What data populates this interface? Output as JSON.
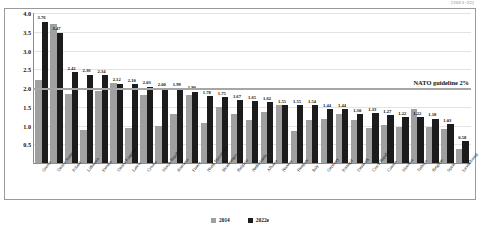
{
  "corner_tag": "[2021-22]",
  "chart_data": {
    "type": "bar",
    "title": "",
    "xlabel": "",
    "ylabel": "",
    "ylim": [
      0,
      4.0
    ],
    "yticks": [
      "0.5",
      "1.0",
      "1.5",
      "2.0",
      "2.5",
      "3.0",
      "3.5",
      "4.0"
    ],
    "grid": true,
    "legend_position": "bottom",
    "annotation": "NATO guideline 2%",
    "guideline_value": 2.0,
    "categories": [
      "Greece",
      "United States",
      "Poland",
      "Lithuania",
      "Estonia",
      "United Kingdom",
      "Latvia",
      "Croatia",
      "Slovak Republic",
      "Romania",
      "France",
      "North Macedonia",
      "Montenegro",
      "Bulgaria",
      "Netherlands",
      "Albania",
      "Norway",
      "Hungary",
      "Italy",
      "Germany",
      "Portugal",
      "Denmark",
      "Czech Republic",
      "Canada",
      "Slovenia",
      "Turkiye",
      "Belgium",
      "Spain",
      "Luxembourg"
    ],
    "series": [
      {
        "name": "2014",
        "color": "#a0a0a0",
        "values": [
          2.21,
          3.7,
          1.85,
          0.88,
          1.93,
          2.14,
          0.94,
          1.82,
          0.99,
          1.32,
          1.82,
          1.06,
          1.5,
          1.31,
          1.15,
          1.35,
          1.54,
          0.86,
          1.14,
          1.18,
          1.31,
          1.15,
          0.94,
          1.01,
          0.97,
          1.45,
          0.97,
          0.92,
          0.38
        ]
      },
      {
        "name": "2022e",
        "color": "#1c1c1c",
        "values": [
          3.76,
          3.47,
          2.42,
          2.36,
          2.34,
          2.12,
          2.1,
          2.03,
          2.0,
          1.99,
          1.9,
          1.78,
          1.75,
          1.67,
          1.65,
          1.62,
          1.55,
          1.55,
          1.54,
          1.44,
          1.44,
          1.3,
          1.33,
          1.27,
          1.22,
          1.22,
          1.18,
          1.03,
          0.58
        ]
      }
    ],
    "value_labels": [
      "3.76",
      "3.47",
      "2.42",
      "2.36",
      "2.34",
      "2.12",
      "2.10",
      "2.03",
      "2.00",
      "1.99",
      "1.90",
      "1.78",
      "1.75",
      "1.67",
      "1.65",
      "1.62",
      "1.55",
      "1.55",
      "1.54",
      "1.44",
      "1.44",
      "1.30",
      "1.33",
      "1.27",
      "1.22",
      "1.22",
      "1.18",
      "1.03",
      "0.58"
    ]
  },
  "legend": {
    "item_2014": "2014",
    "item_2022": "2022e"
  }
}
